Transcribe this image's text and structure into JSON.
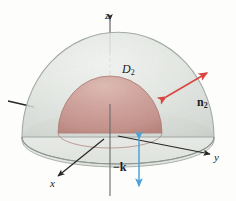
{
  "figure": {
    "width": 236,
    "height": 201,
    "background_color": "#fdfdfc"
  },
  "axes": {
    "z": {
      "label": "z",
      "icon": "axis-arrow-up",
      "direction": "up"
    },
    "y": {
      "label": "y",
      "icon": "axis-arrow-right",
      "direction": "right"
    },
    "x": {
      "label": "x",
      "icon": "axis-arrow-down-left",
      "direction": "down-left"
    },
    "negative_axis_stub": {
      "label": "",
      "icon": "axis-stub-left"
    }
  },
  "surfaces": {
    "outer_hemisphere": {
      "label": "D2",
      "label_text": "D",
      "label_subscript": "2",
      "fill_color": "#dfe3de",
      "edge_color": "#8d9590",
      "description": "large translucent pale gray-green hemisphere"
    },
    "inner_hemisphere": {
      "fill_color": "#cfa099",
      "edge_color": "#ae7f79",
      "description": "small opaque dusty-rose hemisphere"
    },
    "base_disk": {
      "fill_color": "#e8ebe7",
      "edge_color": "#9aa29d",
      "description": "flat elliptical base disk of the outer hemisphere"
    }
  },
  "vectors": {
    "normal_n2": {
      "label_text": "n",
      "label_subscript": "2",
      "color": "#d8463f",
      "icon": "vector-arrow-outward",
      "description": "red outward normal arrow on the outer hemisphere"
    },
    "minus_k": {
      "label_text": "−k",
      "label_subscript": "",
      "color": "#4da3d8",
      "icon": "vector-arrow-double-vertical",
      "description": "blue double-headed vertical arrow pointing down"
    }
  }
}
